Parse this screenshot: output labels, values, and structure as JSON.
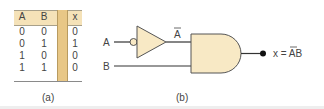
{
  "truth_table": {
    "headers": [
      "A",
      "B",
      "x"
    ],
    "rows": [
      [
        "0",
        "0",
        "0"
      ],
      [
        "0",
        "1",
        "1"
      ],
      [
        "1",
        "0",
        "0"
      ],
      [
        "1",
        "1",
        "0"
      ]
    ]
  },
  "captions": {
    "a": "(a)",
    "b": "(b)"
  },
  "circuit": {
    "input_a": "A",
    "input_b": "B",
    "not_output": "A",
    "output_label": "x = AB",
    "output_prefix": "x = ",
    "output_overbar_var": "A",
    "output_plain_var": "B"
  },
  "colors": {
    "gate_fill": "#f8e9c5",
    "table_header": "#f5e2b8",
    "table_band": "#e8c786",
    "wire": "#333333"
  }
}
